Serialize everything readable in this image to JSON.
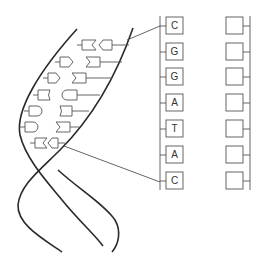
{
  "diagram": {
    "type": "dna-strand-to-sequence",
    "colors": {
      "line": "#2a2a2a",
      "outline": "#555555",
      "background": "#ffffff"
    },
    "sequence_column": {
      "boxes": [
        {
          "letter": "C"
        },
        {
          "letter": "G"
        },
        {
          "letter": "G"
        },
        {
          "letter": "A"
        },
        {
          "letter": "T"
        },
        {
          "letter": "A"
        },
        {
          "letter": "C"
        }
      ]
    },
    "blank_column": {
      "boxes": [
        {
          "letter": ""
        },
        {
          "letter": ""
        },
        {
          "letter": ""
        },
        {
          "letter": ""
        },
        {
          "letter": ""
        },
        {
          "letter": ""
        },
        {
          "letter": ""
        }
      ]
    },
    "pointer_lines": [
      {
        "from": "helix-top",
        "to": "box-1"
      },
      {
        "from": "helix-bottom",
        "to": "box-7"
      }
    ]
  }
}
